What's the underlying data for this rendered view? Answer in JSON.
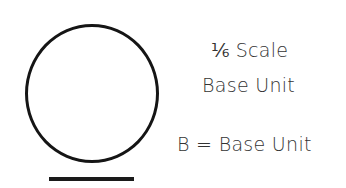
{
  "diagram": {
    "shape": "circle",
    "underline": true,
    "labels": {
      "scale_fraction": "⅙",
      "scale_word": "Scale",
      "line2": "Base Unit",
      "legend": "B = Base Unit"
    }
  }
}
